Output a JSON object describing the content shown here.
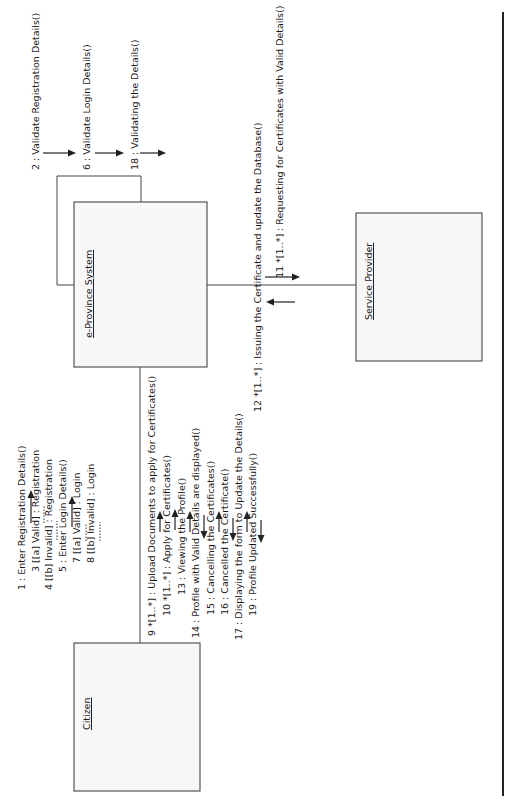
{
  "diagram": {
    "type": "UML communication diagram",
    "orientation": "rotated 90 degrees counter-clockwise",
    "objects": [
      {
        "id": "citizen",
        "label": "Citizen"
      },
      {
        "id": "eprovince",
        "label": "e-Province System"
      },
      {
        "id": "provider",
        "label": "Service Provider"
      }
    ],
    "links": [
      {
        "from": "Citizen",
        "to": "e-Province System"
      },
      {
        "from": "e-Province System",
        "to": "e-Province System"
      },
      {
        "from": "e-Province System",
        "to": "Service Provider"
      }
    ],
    "messages": {
      "m1": "1 : Enter Registration Details()",
      "m2": "2 : Validate Registration Details()",
      "m3": "3 [[a] Valid] : Registration",
      "m4": "4 [[b] Invalid] : Registration",
      "m5": "5 : Enter Login Details()",
      "m6": "6 : Validate Login Details()",
      "m7": "7 [[a] Valid] : Login",
      "m8": "8 [[b] Invalid] : Login",
      "m9": "9 *[1..*] : Upload Documents to apply for Certificates()",
      "m10": "10 *[1..*] : Apply for Certificates()",
      "m11": "11 *[1..*] : Requesting for Certificates with Valid Details()",
      "m12": "12 *[1..*] : Issuing the Certificate and update the Database()",
      "m13": "13 : Viewing the Profile()",
      "m14": "14 : Profile with Valid Details are displayed()",
      "m15": "15 : Cancelling the Certificates()",
      "m16": "16 : Cancelled the Certificate()",
      "m17": "17 : Displaying the form to Update the Details()",
      "m18": "18 : Validating the Details()",
      "m19": "19 : Profile Updated Successfully()"
    },
    "colors": {
      "box_fill": "#f7f7f7",
      "box_stroke": "#555555",
      "line": "#444444",
      "text": "#1a1a1a"
    }
  }
}
